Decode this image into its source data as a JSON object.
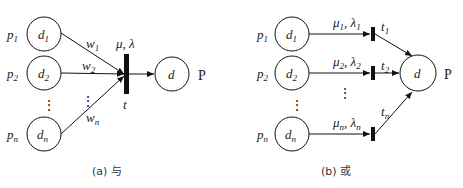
{
  "diagram_a": {
    "caption": "(a) 与",
    "places": [
      {
        "outer": "p",
        "outer_sub": "1",
        "inner": "d",
        "inner_sub": "1"
      },
      {
        "outer": "p",
        "outer_sub": "2",
        "inner": "d",
        "inner_sub": "2"
      },
      {
        "outer": "p",
        "outer_sub": "n",
        "inner": "d",
        "inner_sub": "n"
      }
    ],
    "weights": [
      {
        "base": "w",
        "sub": "1"
      },
      {
        "base": "w",
        "sub": "2"
      },
      {
        "base": "w",
        "sub": "n"
      }
    ],
    "transition": {
      "label": "t",
      "rates": "μ, λ"
    },
    "output": {
      "inner": "d",
      "outer": "P"
    },
    "ellipsis": "⋮"
  },
  "diagram_b": {
    "caption": "(b) 或",
    "places": [
      {
        "outer": "p",
        "outer_sub": "1",
        "inner": "d",
        "inner_sub": "1"
      },
      {
        "outer": "p",
        "outer_sub": "2",
        "inner": "d",
        "inner_sub": "2"
      },
      {
        "outer": "p",
        "outer_sub": "n",
        "inner": "d",
        "inner_sub": "n"
      }
    ],
    "rates": [
      {
        "mu": "μ",
        "lambda": "λ",
        "sub": "1"
      },
      {
        "mu": "μ",
        "lambda": "λ",
        "sub": "2"
      },
      {
        "mu": "μ",
        "lambda": "λ",
        "sub": "n"
      }
    ],
    "transitions": [
      {
        "label": "t",
        "sub": "1"
      },
      {
        "label": "t",
        "sub": "2"
      },
      {
        "label": "t",
        "sub": "n"
      }
    ],
    "output": {
      "inner": "d",
      "outer": "P"
    },
    "ellipsis": "⋮"
  }
}
